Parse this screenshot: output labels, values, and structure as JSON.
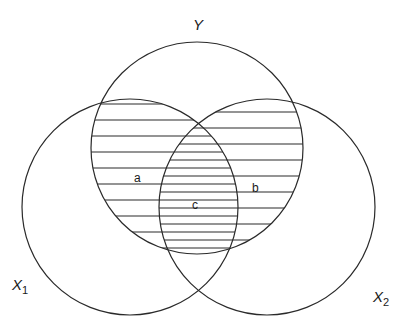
{
  "diagram": {
    "type": "venn",
    "stroke_color": "#2a2a2a",
    "background": "#ffffff",
    "sets": [
      {
        "id": "Y",
        "label": "Y",
        "subscript": "",
        "cx": 197,
        "cy": 148,
        "r": 106,
        "label_x": 193,
        "label_y": 30
      },
      {
        "id": "X1",
        "label": "X",
        "subscript": "1",
        "cx": 130,
        "cy": 207,
        "r": 108,
        "label_x": 12,
        "label_y": 290
      },
      {
        "id": "X2",
        "label": "X",
        "subscript": "2",
        "cx": 267,
        "cy": 207,
        "r": 108,
        "label_x": 373,
        "label_y": 302
      }
    ],
    "regions": [
      {
        "id": "a",
        "label": "a",
        "description": "Y ∩ X1 hatched",
        "x": 134,
        "y": 182
      },
      {
        "id": "b",
        "label": "b",
        "description": "Y ∩ X2 hatched",
        "x": 252,
        "y": 192
      },
      {
        "id": "c",
        "label": "c",
        "description": "Y ∩ X1 ∩ X2 double hatched",
        "x": 192,
        "y": 209
      }
    ],
    "hatch": {
      "a_start_y": 104,
      "b_start_y": 112,
      "spacing": 16
    }
  }
}
